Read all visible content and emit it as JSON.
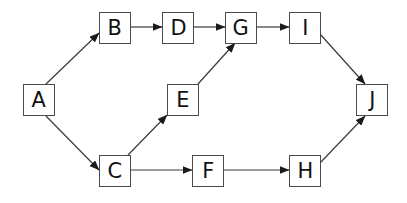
{
  "diagram": {
    "type": "directed-graph",
    "colors": {
      "stroke": "#3a3a3a",
      "node_border": "#4a4a4a",
      "text": "#111111",
      "background": "#ffffff"
    },
    "nodes": [
      {
        "id": "A",
        "label": "A",
        "x": 23,
        "y": 84
      },
      {
        "id": "B",
        "label": "B",
        "x": 99,
        "y": 12
      },
      {
        "id": "D",
        "label": "D",
        "x": 162,
        "y": 12
      },
      {
        "id": "G",
        "label": "G",
        "x": 225,
        "y": 12
      },
      {
        "id": "I",
        "label": "I",
        "x": 289,
        "y": 12
      },
      {
        "id": "E",
        "label": "E",
        "x": 167,
        "y": 84
      },
      {
        "id": "J",
        "label": "J",
        "x": 356,
        "y": 84
      },
      {
        "id": "C",
        "label": "C",
        "x": 99,
        "y": 155
      },
      {
        "id": "F",
        "label": "F",
        "x": 192,
        "y": 155
      },
      {
        "id": "H",
        "label": "H",
        "x": 289,
        "y": 155
      }
    ],
    "edges": [
      {
        "from": "A",
        "to": "B",
        "x1": 46,
        "y1": 84,
        "x2": 99,
        "y2": 33
      },
      {
        "from": "B",
        "to": "D",
        "x1": 131,
        "y1": 27,
        "x2": 162,
        "y2": 27
      },
      {
        "from": "D",
        "to": "G",
        "x1": 194,
        "y1": 27,
        "x2": 225,
        "y2": 27
      },
      {
        "from": "G",
        "to": "I",
        "x1": 257,
        "y1": 27,
        "x2": 289,
        "y2": 27
      },
      {
        "from": "I",
        "to": "J",
        "x1": 320,
        "y1": 34,
        "x2": 365,
        "y2": 84
      },
      {
        "from": "A",
        "to": "C",
        "x1": 46,
        "y1": 116,
        "x2": 99,
        "y2": 170
      },
      {
        "from": "C",
        "to": "E",
        "x1": 128,
        "y1": 155,
        "x2": 167,
        "y2": 115
      },
      {
        "from": "E",
        "to": "G",
        "x1": 198,
        "y1": 84,
        "x2": 235,
        "y2": 43
      },
      {
        "from": "C",
        "to": "F",
        "x1": 131,
        "y1": 170,
        "x2": 192,
        "y2": 170
      },
      {
        "from": "F",
        "to": "H",
        "x1": 224,
        "y1": 170,
        "x2": 289,
        "y2": 170
      },
      {
        "from": "H",
        "to": "J",
        "x1": 320,
        "y1": 163,
        "x2": 365,
        "y2": 116
      }
    ]
  }
}
